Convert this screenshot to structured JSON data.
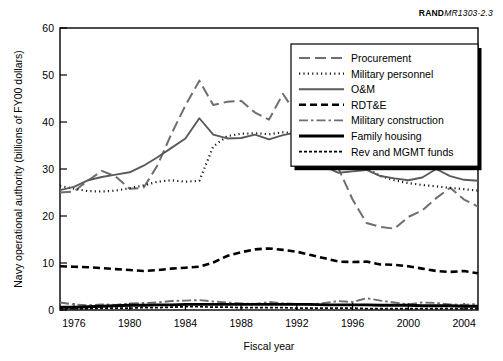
{
  "figure": {
    "id_prefix": "RAND",
    "id_number": "MR1303-2.3"
  },
  "chart_data": {
    "type": "line",
    "title": "",
    "xlabel": "Fiscal year",
    "ylabel": "Navy operational authority (billions of FY00 dollars)",
    "xlim": [
      1975,
      2005
    ],
    "ylim": [
      0,
      60
    ],
    "xticks": [
      1976,
      1980,
      1984,
      1988,
      1992,
      1996,
      2000,
      2004
    ],
    "yticks": [
      0,
      10,
      20,
      30,
      40,
      50,
      60
    ],
    "grid": false,
    "legend_position": "top-right",
    "x": [
      1975,
      1976,
      1977,
      1978,
      1979,
      1980,
      1981,
      1982,
      1983,
      1984,
      1985,
      1986,
      1987,
      1988,
      1989,
      1990,
      1991,
      1992,
      1993,
      1994,
      1995,
      1996,
      1997,
      1998,
      1999,
      2000,
      2001,
      2002,
      2003,
      2004,
      2005
    ],
    "series": [
      {
        "name": "Procurement",
        "style": "long-dash",
        "color": "#6e6e6e",
        "values": [
          25.0,
          25.2,
          27.5,
          29.6,
          28.4,
          25.8,
          26.0,
          30.8,
          37.5,
          43.5,
          48.8,
          43.6,
          44.3,
          44.5,
          42.0,
          40.5,
          46.0,
          41.5,
          37.3,
          37.0,
          30.0,
          23.5,
          18.5,
          17.7,
          17.3,
          19.8,
          21.2,
          23.8,
          26.0,
          23.5,
          22.0
        ]
      },
      {
        "name": "Military personnel",
        "style": "dotted",
        "color": "#1a1a1a",
        "values": [
          26.4,
          25.8,
          25.3,
          25.2,
          25.4,
          25.9,
          26.5,
          27.3,
          27.6,
          27.3,
          27.5,
          34.8,
          37.0,
          37.5,
          37.6,
          37.4,
          37.8,
          37.6,
          37.0,
          34.5,
          32.8,
          31.5,
          30.2,
          28.5,
          27.6,
          27.0,
          26.6,
          26.3,
          26.0,
          25.7,
          25.4
        ]
      },
      {
        "name": "O&M",
        "style": "solid",
        "color": "#5a5a5a",
        "values": [
          25.5,
          26.2,
          27.6,
          28.3,
          28.8,
          29.3,
          30.7,
          32.5,
          34.5,
          36.5,
          40.8,
          37.3,
          36.5,
          36.6,
          37.3,
          36.3,
          37.2,
          37.8,
          33.5,
          30.5,
          29.2,
          29.5,
          29.8,
          28.5,
          28.0,
          27.6,
          28.2,
          30.0,
          28.5,
          27.7,
          27.5
        ]
      },
      {
        "name": "RDT&E",
        "style": "dash",
        "color": "#000000",
        "values": [
          9.3,
          9.2,
          9.1,
          8.9,
          8.7,
          8.5,
          8.3,
          8.5,
          8.8,
          9.0,
          9.2,
          10.1,
          11.5,
          12.3,
          12.9,
          13.1,
          12.8,
          12.4,
          11.7,
          11.0,
          10.3,
          10.2,
          10.3,
          9.7,
          9.6,
          9.3,
          8.8,
          8.3,
          8.1,
          8.3,
          7.8
        ]
      },
      {
        "name": "Military construction",
        "style": "dash-dot",
        "color": "#6e6e6e",
        "values": [
          1.6,
          1.2,
          1.0,
          1.2,
          1.1,
          1.4,
          1.5,
          1.6,
          1.9,
          2.0,
          2.1,
          1.8,
          1.6,
          1.4,
          1.3,
          1.7,
          1.4,
          1.3,
          1.1,
          1.5,
          1.9,
          1.7,
          2.5,
          2.0,
          1.6,
          1.2,
          1.6,
          1.5,
          1.2,
          1.1,
          1.3
        ]
      },
      {
        "name": "Family housing",
        "style": "thick-solid",
        "color": "#000000",
        "values": [
          0.6,
          0.6,
          0.7,
          0.8,
          0.9,
          1.0,
          1.0,
          1.1,
          1.1,
          1.2,
          1.2,
          1.2,
          1.2,
          1.2,
          1.2,
          1.2,
          1.2,
          1.2,
          1.2,
          1.1,
          1.1,
          1.1,
          1.1,
          1.0,
          1.0,
          1.0,
          0.9,
          0.9,
          0.9,
          0.8,
          0.8
        ]
      },
      {
        "name": "Rev and MGMT funds",
        "style": "fine-dash",
        "color": "#000000",
        "values": [
          0.3,
          0.3,
          0.3,
          0.4,
          0.4,
          0.4,
          0.5,
          0.5,
          0.6,
          0.7,
          0.7,
          0.6,
          0.6,
          0.5,
          0.5,
          0.5,
          0.5,
          0.4,
          0.4,
          0.4,
          0.4,
          0.4,
          0.3,
          0.3,
          0.3,
          0.3,
          0.3,
          0.3,
          0.3,
          0.3,
          0.3
        ]
      }
    ]
  }
}
